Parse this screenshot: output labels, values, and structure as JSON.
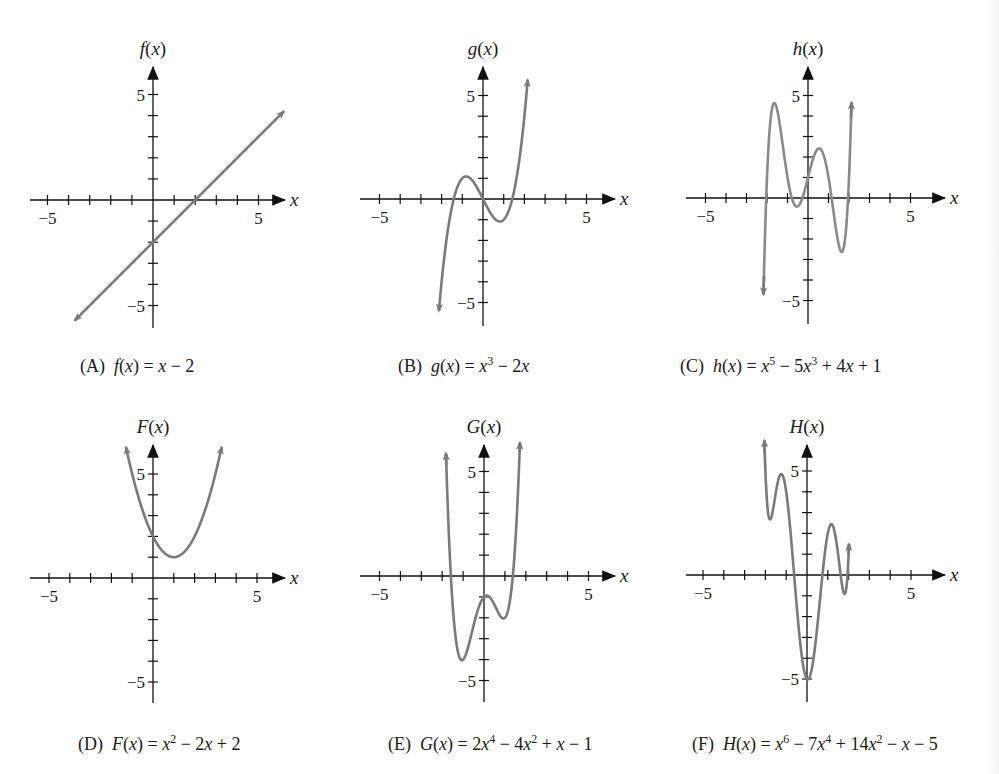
{
  "figure": {
    "background": "#ffffff",
    "axis_color": "#111111",
    "curve_color": "#7a7a7a",
    "curve_color_light": "#b5b5b5"
  },
  "chart_data": [
    {
      "id": "A",
      "type": "line",
      "ylabel": "f(x)",
      "xlabel": "x",
      "caption_letter": "(A)",
      "caption_lhs": "f(x)",
      "caption_rhs": "x − 2",
      "caption_html": "(A)&nbsp; <i>f</i>(<i>x</i>) = <i>x</i> − 2",
      "function": "x - 2",
      "xlim": [
        -6,
        6
      ],
      "ylim": [
        -6,
        6
      ],
      "xticks": [
        -5,
        -4,
        -3,
        -2,
        -1,
        1,
        2,
        3,
        4,
        5
      ],
      "xticklabels": {
        "-5": "−5",
        "5": "5"
      },
      "yticks": [
        -5,
        -4,
        -3,
        -2,
        -1,
        1,
        2,
        3,
        4,
        5
      ],
      "yticklabels": {
        "-5": "−5",
        "5": "5"
      },
      "x_range_drawn": [
        -3.7,
        6.2
      ],
      "arrows": "both",
      "origin_px": [
        153,
        200
      ],
      "unit_px": 21.1,
      "xaxis_px": [
        30,
        285
      ],
      "yaxis_px": [
        67,
        328
      ],
      "caption_px": [
        80,
        373
      ]
    },
    {
      "id": "B",
      "type": "line",
      "ylabel": "g(x)",
      "xlabel": "x",
      "caption_letter": "(B)",
      "caption_lhs": "g(x)",
      "caption_rhs": "x^3 − 2x",
      "caption_html": "(B)&nbsp; <i>g</i>(<i>x</i>) = <i>x</i><sup>3</sup> − 2<i>x</i>",
      "function": "x^3 - 2x",
      "xlim": [
        -6,
        6
      ],
      "ylim": [
        -6,
        6
      ],
      "xticks": [
        -5,
        -4,
        -3,
        -2,
        -1,
        1,
        2,
        3,
        4,
        5
      ],
      "xticklabels": {
        "-5": "−5",
        "5": "5"
      },
      "yticks": [
        -5,
        -4,
        -3,
        -2,
        -1,
        1,
        2,
        3,
        4,
        5
      ],
      "yticklabels": {
        "-5": "−5",
        "5": "5"
      },
      "x_range_drawn": [
        -2.13,
        2.16
      ],
      "arrows": "both",
      "origin_px": [
        483,
        199
      ],
      "unit_px": 20.7,
      "xaxis_px": [
        360,
        615
      ],
      "yaxis_px": [
        67,
        326
      ],
      "caption_px": [
        398,
        373
      ]
    },
    {
      "id": "C",
      "type": "line",
      "ylabel": "h(x)",
      "xlabel": "x",
      "caption_letter": "(C)",
      "caption_lhs": "h(x)",
      "caption_rhs": "x^5 − 5x^3 + 4x + 1",
      "caption_html": "(C)&nbsp; <i>h</i>(<i>x</i>) = <i>x</i><sup>5</sup> − 5<i>x</i><sup>3</sup> + 4<i>x</i> + 1",
      "function": "x^5 - 5x^3 + 4x + 1",
      "xlim": [
        -6,
        6
      ],
      "ylim": [
        -6,
        6
      ],
      "xticks": [
        -5,
        -4,
        -3,
        -2,
        -1,
        1,
        2,
        3,
        4,
        5
      ],
      "xticklabels": {
        "-5": "−5",
        "5": "5"
      },
      "yticks": [
        -5,
        -4,
        -3,
        -2,
        -1,
        1,
        2,
        3,
        4,
        5
      ],
      "yticklabels": {
        "-5": "−5",
        "5": "5"
      },
      "x_range_drawn": [
        -2.17,
        2.12
      ],
      "arrows": "both",
      "origin_px": [
        808,
        198
      ],
      "unit_px": 20.5,
      "xaxis_px": [
        686,
        945
      ],
      "yaxis_px": [
        67,
        324
      ],
      "caption_px": [
        680,
        373
      ]
    },
    {
      "id": "D",
      "type": "line",
      "ylabel": "F(x)",
      "xlabel": "x",
      "caption_letter": "(D)",
      "caption_lhs": "F(x)",
      "caption_rhs": "x^2 − 2x + 2",
      "caption_html": "(D)&nbsp; <i>F</i>(<i>x</i>) = <i>x</i><sup>2</sup> − 2<i>x</i> + 2",
      "function": "x^2 - 2x + 2",
      "xlim": [
        -6,
        6
      ],
      "ylim": [
        -6,
        6
      ],
      "xticks": [
        -5,
        -4,
        -3,
        -2,
        -1,
        1,
        2,
        3,
        4,
        5
      ],
      "xticklabels": {
        "-5": "−5",
        "5": "5"
      },
      "yticks": [
        -5,
        -4,
        -3,
        -2,
        -1,
        1,
        2,
        3,
        4,
        5
      ],
      "yticklabels": {
        "-5": "−5",
        "5": "5"
      },
      "x_range_drawn": [
        -1.3,
        3.3
      ],
      "arrows": "both",
      "origin_px": [
        153,
        578
      ],
      "unit_px": 20.8,
      "xaxis_px": [
        30,
        285
      ],
      "yaxis_px": [
        445,
        703
      ],
      "caption_px": [
        78,
        751
      ]
    },
    {
      "id": "E",
      "type": "line",
      "ylabel": "G(x)",
      "xlabel": "x",
      "caption_letter": "(E)",
      "caption_lhs": "G(x)",
      "caption_rhs": "2x^4 − 4x^2 + x − 1",
      "caption_html": "(E)&nbsp; <i>G</i>(<i>x</i>) = 2<i>x</i><sup>4</sup> − 4<i>x</i><sup>2</sup> + <i>x</i> − 1",
      "function": "2x^4 - 4x^2 + x - 1",
      "xlim": [
        -6,
        6
      ],
      "ylim": [
        -6,
        6
      ],
      "xticks": [
        -5,
        -4,
        -3,
        -2,
        -1,
        1,
        2,
        3,
        4,
        5
      ],
      "xticklabels": {
        "-5": "−5",
        "5": "5"
      },
      "yticks": [
        -5,
        -4,
        -3,
        -2,
        -1,
        1,
        2,
        3,
        4,
        5
      ],
      "yticklabels": {
        "-5": "−5",
        "5": "5"
      },
      "x_range_drawn": [
        -1.82,
        1.72
      ],
      "arrows": "both",
      "origin_px": [
        484,
        576
      ],
      "unit_px": 20.9,
      "xaxis_px": [
        360,
        615
      ],
      "yaxis_px": [
        445,
        702
      ],
      "caption_px": [
        388,
        751
      ]
    },
    {
      "id": "F",
      "type": "line",
      "ylabel": "H(x)",
      "xlabel": "x",
      "caption_letter": "(F)",
      "caption_lhs": "H(x)",
      "caption_rhs": "x^6 − 7x^4 + 14x^2 − x − 5",
      "caption_html": "(F)&nbsp; <i>H</i>(<i>x</i>) = <i>x</i><sup>6</sup> − 7<i>x</i><sup>4</sup> + 14<i>x</i><sup>2</sup> − <i>x</i> − 5",
      "function": "x^6 - 7x^4 + 14x^2 - x - 5",
      "xlim": [
        -6,
        6
      ],
      "ylim": [
        -6,
        6
      ],
      "xticks": [
        -5,
        -4,
        -3,
        -2,
        -1,
        1,
        2,
        3,
        4,
        5
      ],
      "xticklabels": {
        "-5": "−5",
        "5": "5"
      },
      "yticks": [
        -5,
        -4,
        -3,
        -2,
        -1,
        1,
        2,
        3,
        4,
        5
      ],
      "yticklabels": {
        "-5": "−5",
        "5": "5"
      },
      "x_range_drawn": [
        -2.05,
        2.02
      ],
      "arrows": "both",
      "origin_px": [
        807,
        575
      ],
      "unit_px": 20.8,
      "xaxis_px": [
        686,
        945
      ],
      "yaxis_px": [
        445,
        702
      ],
      "caption_px": [
        692,
        751
      ]
    }
  ]
}
